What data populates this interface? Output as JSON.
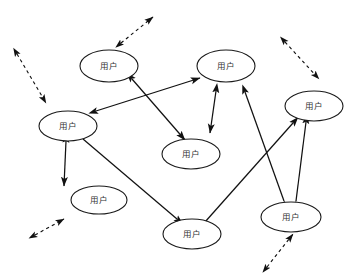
{
  "diagram": {
    "background_color": "#ffffff",
    "stroke_color": "#111111",
    "node_label_color": "#333333",
    "width": 357,
    "height": 278,
    "node_label_text": "用户",
    "nodes": [
      {
        "id": "n1",
        "label": "用户",
        "cx": 109,
        "cy": 66,
        "rx": 29,
        "ry": 16
      },
      {
        "id": "n2",
        "label": "用户",
        "cx": 226,
        "cy": 66,
        "rx": 29,
        "ry": 16
      },
      {
        "id": "n3",
        "label": "用户",
        "cx": 68,
        "cy": 126,
        "rx": 29,
        "ry": 15
      },
      {
        "id": "n4",
        "label": "用户",
        "cx": 314,
        "cy": 106,
        "rx": 29,
        "ry": 15
      },
      {
        "id": "n5",
        "label": "用户",
        "cx": 191,
        "cy": 154,
        "rx": 29,
        "ry": 15
      },
      {
        "id": "n6",
        "label": "用户",
        "cx": 99,
        "cy": 200,
        "rx": 28,
        "ry": 14
      },
      {
        "id": "n7",
        "label": "用户",
        "cx": 291,
        "cy": 217,
        "rx": 30,
        "ry": 15
      },
      {
        "id": "n8",
        "label": "用户",
        "cx": 192,
        "cy": 234,
        "rx": 29,
        "ry": 15
      }
    ],
    "solid_edges": [
      {
        "id": "e1",
        "from": "n1",
        "to": "n5",
        "x1": 132,
        "y1": 79,
        "x2": 185,
        "y2": 140,
        "heads": "both"
      },
      {
        "id": "e2",
        "from": "n3",
        "to": "n2",
        "x1": 96,
        "y1": 111,
        "x2": 200,
        "y2": 78,
        "heads": "both"
      },
      {
        "id": "e3",
        "from": "n2",
        "to": "n5",
        "x1": 216,
        "y1": 91,
        "x2": 210,
        "y2": 133,
        "heads": "both"
      },
      {
        "id": "e4",
        "from": "n3",
        "to": "n6",
        "x1": 66,
        "y1": 141,
        "x2": 64,
        "y2": 186,
        "heads": "both"
      },
      {
        "id": "e5",
        "from": "n3",
        "to": "n8",
        "x1": 83,
        "y1": 139,
        "x2": 177,
        "y2": 219,
        "heads": "both"
      },
      {
        "id": "e6",
        "from": "n7",
        "to": "n2",
        "x1": 284,
        "y1": 201,
        "x2": 245,
        "y2": 92,
        "heads": "both"
      },
      {
        "id": "e7",
        "from": "n7",
        "to": "n4",
        "x1": 296,
        "y1": 201,
        "x2": 306,
        "y2": 122,
        "heads": "both"
      },
      {
        "id": "e8",
        "from": "n8",
        "to": "n4",
        "x1": 205,
        "y1": 222,
        "x2": 293,
        "y2": 123,
        "heads": "both"
      }
    ],
    "dashed_edges": [
      {
        "id": "d1",
        "x1": 121,
        "y1": 43,
        "x2": 153,
        "y2": 17,
        "heads": "both"
      },
      {
        "id": "d2",
        "x1": 17,
        "y1": 54,
        "x2": 46,
        "y2": 103,
        "heads": "both"
      },
      {
        "id": "d3",
        "x1": 285,
        "y1": 42,
        "x2": 319,
        "y2": 79,
        "heads": "both"
      },
      {
        "id": "d4",
        "x1": 35,
        "y1": 235,
        "x2": 64,
        "y2": 219,
        "heads": "both"
      },
      {
        "id": "d5",
        "x1": 267,
        "y1": 267,
        "x2": 293,
        "y2": 234,
        "heads": "both"
      }
    ]
  }
}
